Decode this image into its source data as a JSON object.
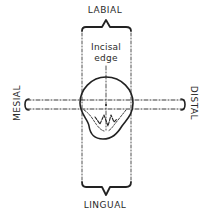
{
  "diagram": {
    "labels": {
      "top": "LABIAL",
      "bottom": "LINGUAL",
      "left": "MESIAL",
      "right": "DISTAL",
      "center_line1": "Incisal",
      "center_line2": "edge"
    },
    "colors": {
      "line": "#222222",
      "background": "#ffffff"
    }
  }
}
